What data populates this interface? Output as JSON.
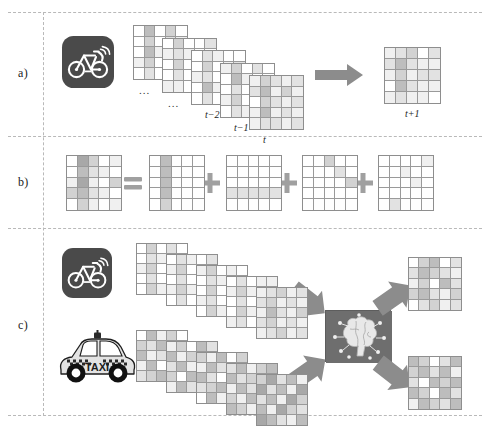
{
  "figure": {
    "panels": [
      {
        "id": "a",
        "label": "a)"
      },
      {
        "id": "b",
        "label": "b)"
      },
      {
        "id": "c",
        "label": "c)"
      }
    ]
  },
  "panel_a": {
    "source_icon": "bikeshare-icon",
    "sequence_labels": [
      "...",
      "...",
      "t−2",
      "t−1",
      "t"
    ],
    "prediction_label": "t+1",
    "arrow": "right-block-arrow"
  },
  "panel_b": {
    "operators": [
      "=",
      "+",
      "+",
      "+"
    ],
    "equals_label": "=",
    "plus_label": "+"
  },
  "panel_c": {
    "source_icons": [
      "bikeshare-icon",
      "taxi-icon"
    ],
    "taxi_text": "TAXI",
    "model_icon": "brain-icon",
    "arrows": [
      "diagonal-block-arrow",
      "diagonal-block-arrow",
      "diagonal-block-arrow",
      "diagonal-block-arrow"
    ]
  },
  "colors": {
    "arrow": "#8c8c8c",
    "operator": "#a0a0a0",
    "grid_line": "#9a9a9a",
    "grid_border": "#8e8e8e",
    "icon_dark": "#4a4a4a",
    "brain_bg": "#6e6e6e",
    "dashed_line": "#b9b9b9",
    "cell_empty": "#ffffff",
    "cell_l1": "#f0f0f0",
    "cell_l2": "#e2e2e2",
    "cell_l3": "#d2d2d2",
    "cell_l4": "#bdbdbd",
    "cell_l5": "#a8a8a8",
    "cell_l6": "#949494"
  },
  "chart_data": {
    "type": "heatmap",
    "grid_rows": 5,
    "grid_cols": 5,
    "shade_scale": [
      0,
      1,
      2,
      3,
      4,
      5,
      6
    ],
    "panel_a": {
      "stack_frames": [
        {
          "label": "...",
          "values": [
            [
              0,
              4,
              0,
              3,
              0
            ],
            [
              0,
              3,
              0,
              2,
              1
            ],
            [
              0,
              4,
              1,
              0,
              0
            ],
            [
              1,
              3,
              0,
              1,
              0
            ],
            [
              0,
              2,
              0,
              0,
              1
            ]
          ]
        },
        {
          "label": "...",
          "values": [
            [
              0,
              3,
              0,
              0,
              2
            ],
            [
              1,
              2,
              1,
              0,
              0
            ],
            [
              0,
              3,
              0,
              1,
              0
            ],
            [
              0,
              2,
              0,
              0,
              1
            ],
            [
              1,
              1,
              0,
              2,
              0
            ]
          ]
        },
        {
          "label": "t−2",
          "values": [
            [
              0,
              2,
              1,
              0,
              0
            ],
            [
              0,
              3,
              0,
              1,
              2
            ],
            [
              1,
              2,
              0,
              0,
              0
            ],
            [
              0,
              4,
              1,
              0,
              1
            ],
            [
              0,
              2,
              0,
              1,
              0
            ]
          ]
        },
        {
          "label": "t−1",
          "values": [
            [
              1,
              3,
              0,
              2,
              0
            ],
            [
              0,
              4,
              1,
              0,
              0
            ],
            [
              0,
              2,
              0,
              1,
              1
            ],
            [
              1,
              3,
              0,
              0,
              0
            ],
            [
              0,
              2,
              1,
              0,
              2
            ]
          ]
        },
        {
          "label": "t",
          "values": [
            [
              1,
              3,
              2,
              1,
              2
            ],
            [
              2,
              4,
              1,
              3,
              1
            ],
            [
              0,
              3,
              2,
              1,
              2
            ],
            [
              1,
              4,
              1,
              2,
              1
            ],
            [
              1,
              2,
              2,
              1,
              2
            ]
          ]
        }
      ],
      "prediction": {
        "label": "t+1",
        "values": [
          [
            1,
            2,
            3,
            0,
            2
          ],
          [
            2,
            4,
            2,
            1,
            1
          ],
          [
            1,
            3,
            1,
            2,
            2
          ],
          [
            0,
            4,
            2,
            1,
            1
          ],
          [
            1,
            2,
            1,
            1,
            0
          ]
        ]
      }
    },
    "panel_b": {
      "result": {
        "values": [
          [
            0,
            5,
            3,
            0,
            1
          ],
          [
            0,
            4,
            2,
            1,
            0
          ],
          [
            1,
            5,
            1,
            0,
            3
          ],
          [
            3,
            4,
            2,
            1,
            0
          ],
          [
            0,
            3,
            1,
            0,
            1
          ]
        ]
      },
      "components": [
        {
          "values": [
            [
              0,
              4,
              0,
              0,
              0
            ],
            [
              0,
              4,
              0,
              0,
              0
            ],
            [
              0,
              4,
              0,
              0,
              0
            ],
            [
              0,
              4,
              0,
              0,
              0
            ],
            [
              0,
              3,
              0,
              0,
              0
            ]
          ]
        },
        {
          "values": [
            [
              0,
              0,
              0,
              0,
              0
            ],
            [
              0,
              0,
              0,
              0,
              0
            ],
            [
              0,
              0,
              0,
              0,
              0
            ],
            [
              2,
              2,
              2,
              2,
              2
            ],
            [
              0,
              0,
              0,
              0,
              0
            ]
          ]
        },
        {
          "values": [
            [
              0,
              0,
              3,
              0,
              0
            ],
            [
              0,
              0,
              0,
              2,
              0
            ],
            [
              0,
              0,
              0,
              0,
              3
            ],
            [
              0,
              0,
              0,
              0,
              0
            ],
            [
              0,
              0,
              0,
              0,
              0
            ]
          ]
        },
        {
          "values": [
            [
              0,
              0,
              0,
              0,
              1
            ],
            [
              0,
              0,
              1,
              0,
              0
            ],
            [
              0,
              0,
              0,
              1,
              0
            ],
            [
              0,
              0,
              0,
              0,
              0
            ],
            [
              0,
              2,
              0,
              0,
              0
            ]
          ]
        }
      ]
    },
    "panel_c": {
      "bike_stack": [
        {
          "values": [
            [
              0,
              3,
              0,
              2,
              0
            ],
            [
              0,
              2,
              1,
              0,
              1
            ],
            [
              1,
              3,
              0,
              1,
              0
            ],
            [
              0,
              2,
              0,
              0,
              1
            ],
            [
              0,
              3,
              1,
              0,
              0
            ]
          ]
        },
        {
          "values": [
            [
              0,
              2,
              1,
              0,
              2
            ],
            [
              1,
              3,
              0,
              1,
              0
            ],
            [
              0,
              2,
              0,
              0,
              1
            ],
            [
              1,
              3,
              1,
              0,
              0
            ],
            [
              0,
              2,
              0,
              1,
              1
            ]
          ]
        },
        {
          "values": [
            [
              1,
              3,
              0,
              1,
              0
            ],
            [
              0,
              2,
              1,
              0,
              2
            ],
            [
              0,
              3,
              0,
              1,
              0
            ],
            [
              1,
              2,
              0,
              0,
              1
            ],
            [
              0,
              3,
              1,
              0,
              0
            ]
          ]
        },
        {
          "values": [
            [
              0,
              2,
              0,
              1,
              1
            ],
            [
              1,
              3,
              1,
              0,
              0
            ],
            [
              0,
              2,
              0,
              2,
              1
            ],
            [
              0,
              3,
              1,
              0,
              0
            ],
            [
              1,
              2,
              0,
              1,
              2
            ]
          ]
        },
        {
          "values": [
            [
              1,
              2,
              3,
              1,
              2
            ],
            [
              2,
              3,
              1,
              2,
              1
            ],
            [
              1,
              4,
              2,
              1,
              3
            ],
            [
              2,
              3,
              1,
              2,
              1
            ],
            [
              1,
              2,
              3,
              1,
              2
            ]
          ]
        }
      ],
      "taxi_stack": [
        {
          "values": [
            [
              0,
              4,
              1,
              3,
              0
            ],
            [
              3,
              2,
              4,
              1,
              2
            ],
            [
              4,
              1,
              2,
              4,
              1
            ],
            [
              1,
              4,
              0,
              2,
              3
            ],
            [
              2,
              3,
              4,
              1,
              0
            ]
          ]
        },
        {
          "values": [
            [
              1,
              3,
              0,
              4,
              2
            ],
            [
              4,
              1,
              3,
              0,
              4
            ],
            [
              2,
              4,
              1,
              3,
              1
            ],
            [
              3,
              0,
              4,
              2,
              3
            ],
            [
              1,
              4,
              2,
              0,
              4
            ]
          ]
        },
        {
          "values": [
            [
              3,
              1,
              4,
              0,
              3
            ],
            [
              1,
              4,
              2,
              3,
              1
            ],
            [
              4,
              2,
              0,
              4,
              2
            ],
            [
              2,
              3,
              4,
              1,
              3
            ],
            [
              0,
              4,
              1,
              3,
              2
            ]
          ]
        },
        {
          "values": [
            [
              2,
              4,
              1,
              3,
              4
            ],
            [
              4,
              2,
              3,
              1,
              2
            ],
            [
              1,
              4,
              2,
              4,
              0
            ],
            [
              3,
              1,
              4,
              2,
              3
            ],
            [
              4,
              3,
              1,
              4,
              1
            ]
          ]
        },
        {
          "values": [
            [
              3,
              5,
              2,
              4,
              1
            ],
            [
              5,
              2,
              4,
              1,
              5
            ],
            [
              2,
              4,
              1,
              5,
              3
            ],
            [
              4,
              1,
              5,
              3,
              2
            ],
            [
              5,
              4,
              2,
              1,
              4
            ]
          ]
        }
      ],
      "outputs": [
        {
          "values": [
            [
              0,
              3,
              4,
              0,
              2
            ],
            [
              2,
              4,
              3,
              2,
              1
            ],
            [
              1,
              3,
              0,
              4,
              2
            ],
            [
              3,
              4,
              2,
              1,
              3
            ],
            [
              0,
              2,
              3,
              1,
              2
            ]
          ]
        },
        {
          "values": [
            [
              4,
              3,
              0,
              2,
              4
            ],
            [
              3,
              4,
              2,
              4,
              1
            ],
            [
              2,
              0,
              4,
              3,
              4
            ],
            [
              4,
              3,
              0,
              4,
              2
            ],
            [
              1,
              4,
              3,
              2,
              4
            ]
          ]
        }
      ]
    }
  }
}
